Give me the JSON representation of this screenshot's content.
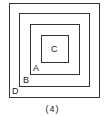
{
  "diagram": {
    "type": "nested-squares",
    "squares": [
      {
        "label": "D",
        "left": 9,
        "top": 3,
        "size": 91
      },
      {
        "label": "B",
        "left": 19,
        "top": 13,
        "size": 71
      },
      {
        "label": "A",
        "left": 30,
        "top": 24,
        "size": 50
      },
      {
        "label": "C",
        "left": 41,
        "top": 35,
        "size": 28
      }
    ],
    "labels": {
      "C": "C",
      "A": "A",
      "B": "B",
      "D": "D"
    },
    "caption": "(4)"
  }
}
